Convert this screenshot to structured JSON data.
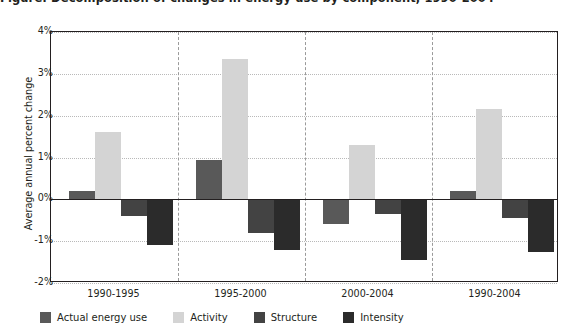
{
  "chart_data": {
    "type": "bar",
    "title": "Figure: Decomposition of changes in energy use by component, 1990-2004",
    "subtitle": "",
    "xlabel": "",
    "ylabel": "Average annual percent change",
    "categories": [
      "1990-1995",
      "1995-2000",
      "2000-2004",
      "1990-2004"
    ],
    "series": [
      {
        "name": "Actual energy use",
        "color": "#595959",
        "values": [
          0.2,
          0.95,
          -0.6,
          0.2
        ]
      },
      {
        "name": "Activity",
        "color": "#d4d4d4",
        "values": [
          1.6,
          3.35,
          1.3,
          2.15
        ]
      },
      {
        "name": "Structure",
        "color": "#434343",
        "values": [
          -0.4,
          -0.8,
          -0.35,
          -0.45
        ]
      },
      {
        "name": "Intensity",
        "color": "#2b2b2b",
        "values": [
          -1.1,
          -1.2,
          -1.45,
          -1.25
        ]
      }
    ],
    "ylim": [
      -2,
      4
    ],
    "yticks": [
      4,
      3,
      2,
      1,
      0,
      -1,
      -2
    ],
    "ytick_labels": [
      "4%",
      "3%",
      "2%",
      "1%",
      "0%",
      "-1%",
      "-2%"
    ],
    "grid": "horizontal-dotted",
    "group_separators": "vertical-dashed",
    "legend_position": "bottom",
    "zero_line": 0
  },
  "legend": {
    "items": [
      {
        "label": "Actual energy use",
        "color": "#595959"
      },
      {
        "label": "Activity",
        "color": "#d4d4d4"
      },
      {
        "label": "Structure",
        "color": "#434343"
      },
      {
        "label": "Intensity",
        "color": "#2b2b2b"
      }
    ]
  }
}
